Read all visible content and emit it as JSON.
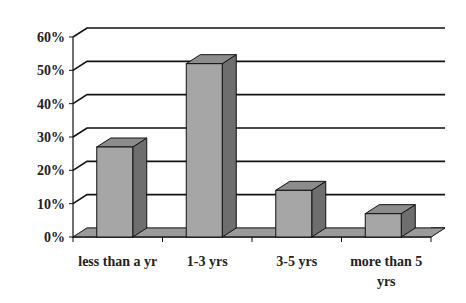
{
  "chart_data": {
    "type": "bar",
    "style": "3d-column",
    "title": "",
    "xlabel": "",
    "ylabel": "",
    "categories": [
      "less than a yr",
      "1-3 yrs",
      "3-5 yrs",
      "more than 5 yrs"
    ],
    "category_label_lines": [
      [
        "less than a yr"
      ],
      [
        "1-3 yrs"
      ],
      [
        "3-5 yrs"
      ],
      [
        "more than 5",
        "yrs"
      ]
    ],
    "values": [
      27,
      52,
      14,
      7
    ],
    "value_unit": "%",
    "ylim": [
      0,
      60
    ],
    "yticks": [
      0,
      10,
      20,
      30,
      40,
      50,
      60
    ],
    "ytick_labels": [
      "0%",
      "10%",
      "20%",
      "30%",
      "40%",
      "50%",
      "60%"
    ],
    "grid": true,
    "legend": "none",
    "colors": {
      "bar_front": "#a6a6a6",
      "bar_top": "#8c8c8c",
      "bar_side": "#6e6e6e",
      "floor": "#9a9a9a",
      "grid": "#111111",
      "axis": "#111111"
    }
  }
}
